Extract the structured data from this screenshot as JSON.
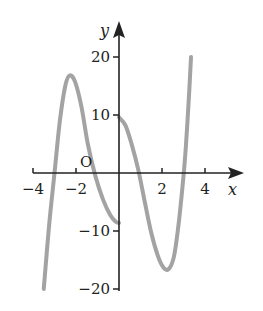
{
  "chart_data": {
    "type": "line",
    "title": "",
    "xlabel": "x",
    "ylabel": "y",
    "origin_label": "O",
    "xlim": [
      -4,
      5.3
    ],
    "ylim": [
      -20,
      26
    ],
    "xticks": [
      -4,
      -2,
      2,
      4
    ],
    "xtick_labels": [
      "−4",
      "−2",
      "2",
      "4"
    ],
    "yticks": [
      20,
      10,
      -10,
      -20
    ],
    "ytick_labels": [
      "20",
      "10",
      "−10",
      "−20"
    ],
    "grid": false,
    "legend": null,
    "series": [
      {
        "name": "branch-left (x ≤ 0)",
        "color": "#a3a3a3",
        "points": [
          [
            -3.5,
            -20
          ],
          [
            -3.25,
            -9
          ],
          [
            -3.0,
            0
          ],
          [
            -2.75,
            9
          ],
          [
            -2.5,
            15
          ],
          [
            -2.3,
            16.8
          ],
          [
            -2.05,
            15.8
          ],
          [
            -1.75,
            11.5
          ],
          [
            -1.45,
            5
          ],
          [
            -1.1,
            -0.5
          ],
          [
            -0.75,
            -4.5
          ],
          [
            -0.4,
            -7.3
          ],
          [
            -0.15,
            -8.4
          ],
          [
            0,
            -8.6
          ]
        ]
      },
      {
        "name": "branch-right (x ≥ 0)",
        "color": "#a3a3a3",
        "points": [
          [
            0,
            9.6
          ],
          [
            0.3,
            8.2
          ],
          [
            0.6,
            4.8
          ],
          [
            0.9,
            0.5
          ],
          [
            1.2,
            -5
          ],
          [
            1.5,
            -10.3
          ],
          [
            1.8,
            -14.2
          ],
          [
            2.05,
            -16.2
          ],
          [
            2.3,
            -16.6
          ],
          [
            2.55,
            -14.5
          ],
          [
            2.75,
            -9.5
          ],
          [
            2.95,
            -2.5
          ],
          [
            3.1,
            4
          ],
          [
            3.25,
            13
          ],
          [
            3.35,
            20
          ]
        ]
      }
    ]
  },
  "layout": {
    "origin_px": [
      119,
      173
    ],
    "x_unit_px": 21.5,
    "y_unit_px": 5.8
  }
}
